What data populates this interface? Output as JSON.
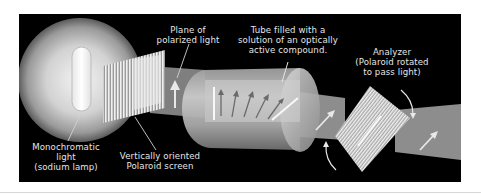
{
  "diagram": {
    "labels": {
      "light_source": {
        "lines": [
          "Monochromatic",
          "light",
          "(sodium lamp)"
        ]
      },
      "polarizer": {
        "lines": [
          "Vertically oriented",
          "Polaroid screen"
        ]
      },
      "polarized_plane": {
        "lines": [
          "Plane of",
          "polarized light"
        ]
      },
      "sample_tube": {
        "lines": [
          "Tube filled with a",
          "solution of an optically",
          "active compound."
        ]
      },
      "analyzer": {
        "lines": [
          "Analyzer",
          "(Polaroid rotated",
          "to pass light)"
        ]
      }
    },
    "components": [
      {
        "id": "lamp",
        "name": "Monochromatic light (sodium lamp)"
      },
      {
        "id": "polarizer",
        "name": "Vertically oriented Polaroid screen"
      },
      {
        "id": "tube",
        "name": "Tube filled with a solution of an optically active compound"
      },
      {
        "id": "analyzer",
        "name": "Analyzer (Polaroid rotated to pass light)"
      }
    ],
    "tube_arrow_count": 5,
    "colors": {
      "background": "#000000",
      "beam": "#8a8a8a",
      "label_text": "#e6e6e6",
      "lamp_glow": "#dcdcdc"
    }
  }
}
